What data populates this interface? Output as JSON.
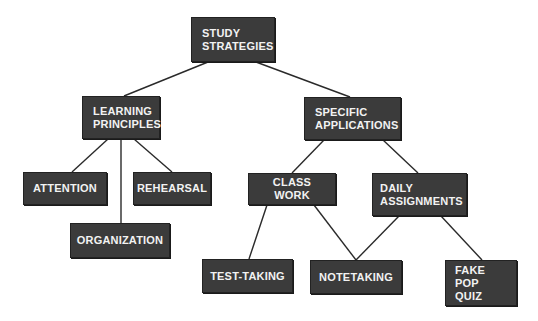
{
  "diagram": {
    "type": "concept-map",
    "nodes": {
      "root": {
        "label": "STUDY\nSTRATEGIES"
      },
      "learning_principles": {
        "label": "LEARNING\nPRINCIPLES"
      },
      "specific_applications": {
        "label": "SPECIFIC\nAPPLICATIONS"
      },
      "attention": {
        "label": "ATTENTION"
      },
      "rehearsal": {
        "label": "REHEARSAL"
      },
      "organization": {
        "label": "ORGANIZATION"
      },
      "class_work": {
        "label": "CLASS WORK"
      },
      "daily_assignments": {
        "label": "DAILY\nASSIGNMENTS"
      },
      "test_taking": {
        "label": "TEST-TAKING"
      },
      "notetaking": {
        "label": "NOTETAKING"
      },
      "fake_pop_quiz": {
        "label": "FAKE POP\nQUIZ"
      }
    },
    "edges": [
      {
        "from": "root",
        "to": "learning_principles"
      },
      {
        "from": "root",
        "to": "specific_applications"
      },
      {
        "from": "learning_principles",
        "to": "attention"
      },
      {
        "from": "learning_principles",
        "to": "organization"
      },
      {
        "from": "learning_principles",
        "to": "rehearsal"
      },
      {
        "from": "specific_applications",
        "to": "class_work"
      },
      {
        "from": "specific_applications",
        "to": "daily_assignments"
      },
      {
        "from": "class_work",
        "to": "test_taking"
      },
      {
        "from": "class_work",
        "to": "notetaking"
      },
      {
        "from": "daily_assignments",
        "to": "notetaking"
      },
      {
        "from": "daily_assignments",
        "to": "fake_pop_quiz"
      }
    ],
    "colors": {
      "node_fill": "#3b3b3b",
      "node_text": "#f2f2f2",
      "edge": "#2a2a2a",
      "background": "#ffffff"
    }
  }
}
